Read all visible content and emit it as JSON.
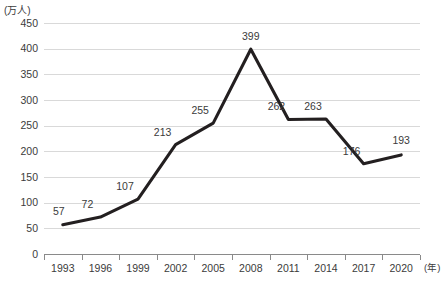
{
  "chart_data": {
    "type": "line",
    "title": "",
    "subtitle": "",
    "xlabel": "(年)",
    "ylabel": "(万人)",
    "categories": [
      "1993",
      "1996",
      "1999",
      "2002",
      "2005",
      "2008",
      "2011",
      "2014",
      "2017",
      "2020"
    ],
    "values": [
      57,
      72,
      107,
      213,
      255,
      399,
      262,
      263,
      176,
      193
    ],
    "series": [
      {
        "name": "",
        "values": [
          57,
          72,
          107,
          213,
          255,
          399,
          262,
          263,
          176,
          193
        ]
      }
    ],
    "point_labels": [
      "57",
      "72",
      "107",
      "213",
      "255",
      "399",
      "262",
      "263",
      "176",
      "193"
    ],
    "y_ticks": [
      0,
      50,
      100,
      150,
      200,
      250,
      300,
      350,
      400,
      450
    ],
    "y_tick_labels": [
      "0",
      "50",
      "100",
      "150",
      "200",
      "250",
      "300",
      "350",
      "400",
      "450"
    ],
    "ylim": [
      0,
      450
    ],
    "xlim": [
      "1993",
      "2020"
    ],
    "grid": true,
    "grid_axis": "y",
    "legend": false,
    "legend_position": "none",
    "line_color": "#231f20",
    "grid_color": "#d9d9d9",
    "axis_color": "#8a8a8a",
    "text_color": "#3b3b3b",
    "background_color": "#ffffff",
    "markers": false,
    "data_labels_visible": true,
    "x_tick_interval_years": 3
  }
}
